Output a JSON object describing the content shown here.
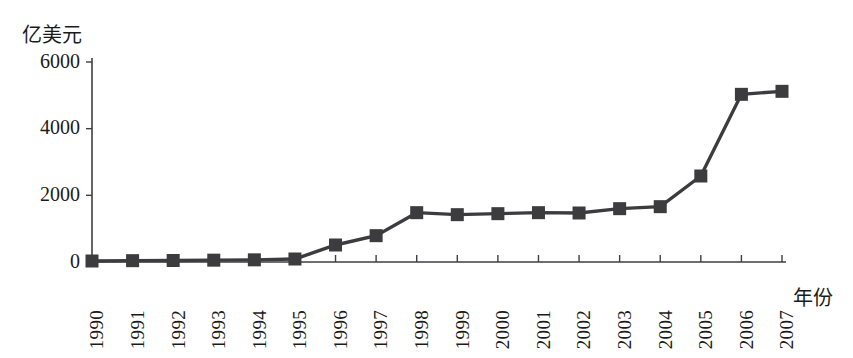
{
  "chart_data": {
    "type": "line",
    "title": "",
    "subtitle": "",
    "ylabel": "亿美元",
    "xlabel": "年份",
    "categories": [
      "1990",
      "1991",
      "1992",
      "1993",
      "1994",
      "1995",
      "1996",
      "1997",
      "1998",
      "1999",
      "2000",
      "2001",
      "2002",
      "2003",
      "2004",
      "2005",
      "2006",
      "2007"
    ],
    "values": [
      30,
      40,
      45,
      55,
      65,
      90,
      510,
      790,
      1480,
      1420,
      1450,
      1480,
      1470,
      1600,
      1660,
      2580,
      5030,
      5120
    ],
    "series": [
      {
        "name": "",
        "values": [
          30,
          40,
          45,
          55,
          65,
          90,
          510,
          790,
          1480,
          1420,
          1450,
          1480,
          1470,
          1600,
          1660,
          2580,
          5030,
          5120
        ]
      }
    ],
    "ylim": [
      0,
      6000
    ],
    "yticks": [
      0,
      2000,
      4000,
      6000
    ],
    "ytick_labels": [
      "0",
      "2000",
      "4000",
      "6000"
    ],
    "xtick_labels": [
      "1990",
      "1991",
      "1992",
      "1993",
      "1994",
      "1995",
      "1996",
      "1997",
      "1998",
      "1999",
      "2000",
      "2001",
      "2002",
      "2003",
      "2004",
      "2005",
      "2006",
      "2007"
    ],
    "grid": false,
    "legend": false,
    "legend_position": "none",
    "marker": "square",
    "series_color": "#3c3c3e",
    "axis_color": "#3f3f42",
    "text_color": "#1b1b1b",
    "background": "#ffffff",
    "xtick_rotation": -90
  },
  "labels": {
    "y_axis_unit": "亿美元",
    "x_axis_name": "年份"
  }
}
